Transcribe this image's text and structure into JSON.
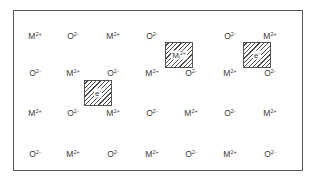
{
  "diagram": {
    "title": "",
    "colors": {
      "text": "#3a3a3a",
      "frame": "#555555",
      "hatch": "#4a4a4a",
      "background": "#ffffff"
    },
    "columns_x": [
      35,
      73,
      113,
      152,
      191,
      230,
      270
    ],
    "rows_y": [
      36,
      73,
      113,
      154
    ],
    "rows": [
      [
        {
          "base": "M",
          "charge": "2+"
        },
        {
          "base": "O",
          "charge": "2-"
        },
        {
          "base": "M",
          "charge": "2+"
        },
        {
          "base": "O",
          "charge": "2-"
        },
        null,
        {
          "base": "O",
          "charge": "2-"
        },
        {
          "base": "M",
          "charge": "2+"
        }
      ],
      [
        {
          "base": "O",
          "charge": "2-"
        },
        {
          "base": "M",
          "charge": "2+"
        },
        {
          "base": "O",
          "charge": "2-"
        },
        {
          "base": "M",
          "charge": "2+"
        },
        {
          "base": "O",
          "charge": "2-"
        },
        {
          "base": "M",
          "charge": "2+"
        },
        {
          "base": "O",
          "charge": "2-"
        }
      ],
      [
        {
          "base": "M",
          "charge": "2+"
        },
        {
          "base": "O",
          "charge": "2-"
        },
        {
          "base": "M",
          "charge": "2+"
        },
        {
          "base": "O",
          "charge": "2-"
        },
        {
          "base": "M",
          "charge": "2+"
        },
        {
          "base": "O",
          "charge": "2-"
        },
        {
          "base": "M",
          "charge": "2+"
        }
      ],
      [
        {
          "base": "O",
          "charge": "2-"
        },
        {
          "base": "M",
          "charge": "2+"
        },
        {
          "base": "O",
          "charge": "2-"
        },
        {
          "base": "M",
          "charge": "2+"
        },
        {
          "base": "O",
          "charge": "2-"
        },
        {
          "base": "M",
          "charge": "2+"
        },
        {
          "base": "O",
          "charge": "2-"
        }
      ]
    ],
    "defects": [
      {
        "id": "electron-at-oxygen-vacuncy-1",
        "type": "trapped-electron",
        "label": "e",
        "charge": "-",
        "sub": "",
        "x": 84,
        "y": 80,
        "w": 28,
        "h": 26
      },
      {
        "id": "interstitial-metal",
        "type": "interstitial-cation",
        "label": "M",
        "sub": "i",
        "charge": "2+",
        "x": 165,
        "y": 42,
        "w": 28,
        "h": 26
      },
      {
        "id": "electron-at-oxygen-vacancy-2",
        "type": "trapped-electron",
        "label": "e",
        "charge": "-",
        "sub": "",
        "x": 243,
        "y": 42,
        "w": 28,
        "h": 26
      }
    ]
  }
}
